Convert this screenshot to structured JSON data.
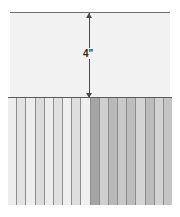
{
  "figure": {
    "background_color": "#ffffff"
  },
  "upper_panel": {
    "name": "blank upper panel",
    "fill_color": "#f2f2f2",
    "top_edge_color": "#6e6e6e",
    "divider_color": "#5a5a5a"
  },
  "dimension": {
    "label": "4\"",
    "value": 4,
    "unit": "inch",
    "orientation": "vertical",
    "line_color": "#4a4a4a",
    "arrow_style": "double-headed"
  },
  "lower_panel": {
    "name": "vertical striped plank region",
    "stripe_count": 18,
    "stripe_line_color": "#8d8d8d",
    "stripes": [
      {
        "index": 1,
        "color": "#ededed",
        "group": "left"
      },
      {
        "index": 2,
        "color": "#e3e3e3",
        "group": "left"
      },
      {
        "index": 3,
        "color": "#ededed",
        "group": "left"
      },
      {
        "index": 4,
        "color": "#dcdcdc",
        "group": "left"
      },
      {
        "index": 5,
        "color": "#ececec",
        "group": "left"
      },
      {
        "index": 6,
        "color": "#e0e0e0",
        "group": "left"
      },
      {
        "index": 7,
        "color": "#efefef",
        "group": "left"
      },
      {
        "index": 8,
        "color": "#dedede",
        "group": "left"
      },
      {
        "index": 9,
        "color": "#f0f0f0",
        "group": "left"
      },
      {
        "index": 10,
        "color": "#a5a5a5",
        "group": "center-highlight"
      },
      {
        "index": 11,
        "color": "#cfcfcf",
        "group": "right"
      },
      {
        "index": 12,
        "color": "#b9b9b9",
        "group": "right"
      },
      {
        "index": 13,
        "color": "#c9c9c9",
        "group": "right"
      },
      {
        "index": 14,
        "color": "#bdbdbd",
        "group": "right"
      },
      {
        "index": 15,
        "color": "#d4d4d4",
        "group": "right"
      },
      {
        "index": 16,
        "color": "#bcbcbc",
        "group": "right"
      },
      {
        "index": 17,
        "color": "#d2d2d2",
        "group": "right"
      },
      {
        "index": 18,
        "color": "#c4c4c4",
        "group": "right"
      }
    ]
  }
}
